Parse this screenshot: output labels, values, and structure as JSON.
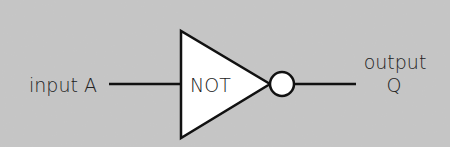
{
  "diagram": {
    "type": "logic-gate",
    "background": "#c6c6c6",
    "gate": {
      "label": "NOT",
      "fill": "#ffffff",
      "stroke": "#111111"
    },
    "input": {
      "label": "input A"
    },
    "output": {
      "label_line1": "output",
      "label_line2": "Q"
    }
  }
}
